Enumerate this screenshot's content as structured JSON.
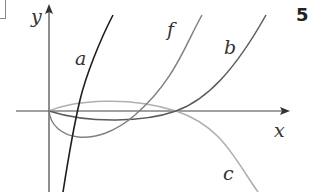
{
  "figure": {
    "problem_number": "5",
    "axes": {
      "x_label": "x",
      "y_label": "y"
    },
    "curves": [
      {
        "label": "a",
        "color": "#222222",
        "description": "steep increasing curve crossing x-axis right of origin"
      },
      {
        "label": "f",
        "color": "#777777",
        "description": "starts at origin, dips below x-axis, then rises"
      },
      {
        "label": "b",
        "color": "#555555",
        "description": "starts at origin, slightly below x-axis, then rises"
      },
      {
        "label": "c",
        "color": "#aaaaaa",
        "description": "starts at origin, slightly above x-axis, then falls"
      }
    ]
  }
}
